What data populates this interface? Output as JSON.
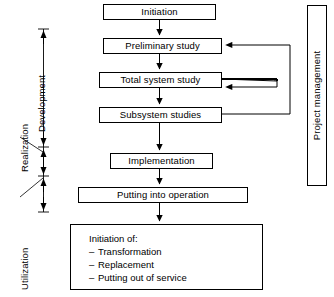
{
  "diagram": {
    "process_boxes": [
      {
        "id": "initiation",
        "label": "Initiation"
      },
      {
        "id": "preliminary-study",
        "label": "Preliminary study"
      },
      {
        "id": "total-system-study",
        "label": "Total system study"
      },
      {
        "id": "subsystem-studies",
        "label": "Subsystem studies"
      },
      {
        "id": "implementation",
        "label": "Implementation"
      },
      {
        "id": "putting-into-operation",
        "label": "Putting into operation"
      }
    ],
    "terminal_box": {
      "id": "initiation-of",
      "heading": "Initiation of:",
      "items": [
        "Transformation",
        "Replacement",
        "Putting out of service"
      ],
      "bullet": "–"
    },
    "phase_labels": [
      {
        "id": "development",
        "label": "Development"
      },
      {
        "id": "realization",
        "label": "Realization"
      },
      {
        "id": "utilization",
        "label": "Utilization"
      }
    ],
    "side_box": {
      "id": "project-management",
      "label": "Project management"
    },
    "feedback_loops": [
      {
        "id": "subsystem-to-preliminary",
        "from": "Subsystem studies",
        "to": "Preliminary study"
      },
      {
        "id": "total-system-to-total-system",
        "from": "Total system study",
        "to": "Total system study"
      }
    ],
    "colors": {
      "stroke": "#000000",
      "fill": "#ffffff"
    }
  }
}
